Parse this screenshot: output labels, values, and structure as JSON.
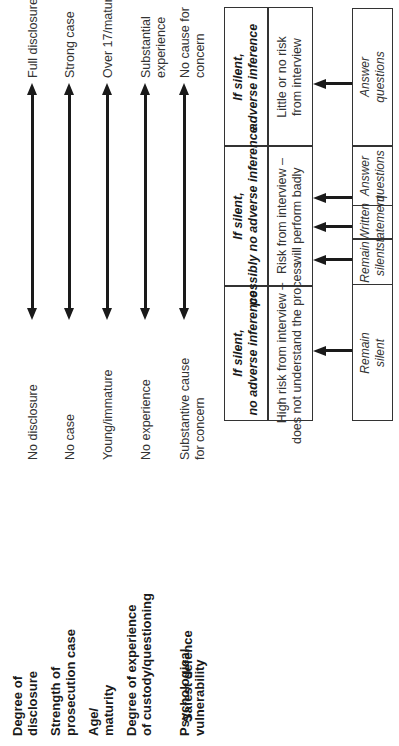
{
  "figure": {
    "orientation": "rotated 90 degrees counter-clockwise",
    "factors": [
      {
        "label": "Degree of\ndisclosure",
        "low": "No disclosure",
        "high": "Full disclosure"
      },
      {
        "label": "Strength of\nprosecution case",
        "low": "No case",
        "high": "Strong case"
      },
      {
        "label": "Age/\nmaturity",
        "low": "Young/immature",
        "high": "Over 17/mature"
      },
      {
        "label": "Degree of experience\nof custody/questioning",
        "low": "No experience",
        "high": "Substantial\nexperience"
      },
      {
        "label": "Psychological\nvulnerability",
        "low": "Substantive cause\nfor concern",
        "high": "No cause for\nconcern"
      }
    ],
    "table": {
      "columns": [
        {
          "header": "If silent,\nno adverse inference",
          "body": "High risk from interview –\ndoes not understand the process"
        },
        {
          "header": "If silent,\npossibly no adverse inference",
          "body": "Risk from interview –\nwill perform badly"
        },
        {
          "header": "If silent,\nadverse inference",
          "body": "Little or no risk\nfrom interview"
        }
      ]
    },
    "safest_defence": {
      "label": "Safest defence",
      "options": [
        {
          "text": "Remain\nsilent"
        },
        {
          "text": "Remain\nsilent"
        },
        {
          "text": "Written\nstatement"
        },
        {
          "text": "Answer\nquestions"
        },
        {
          "text": "Answer\nquestions"
        }
      ]
    }
  }
}
